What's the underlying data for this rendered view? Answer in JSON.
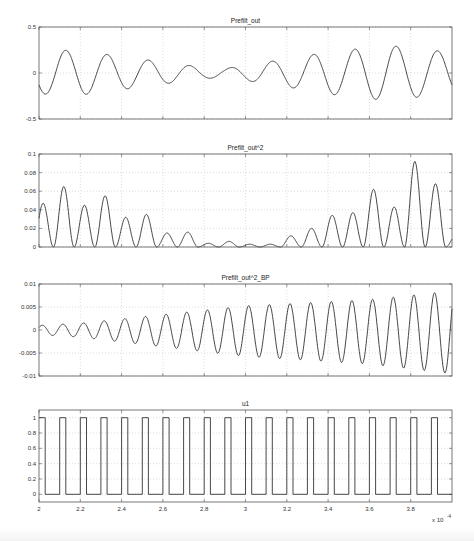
{
  "chart_data": [
    {
      "type": "line",
      "title": "Prefilt_out",
      "xlabel": "",
      "ylabel": "",
      "xlim": [
        2.0,
        4.0
      ],
      "ylim": [
        -0.5,
        0.5
      ],
      "yticks": [
        "0.5",
        "0",
        "-0.5"
      ],
      "ytick_values": [
        0.5,
        0,
        -0.5
      ],
      "grid": true,
      "signal_model": "sinusoid with slowly varying amplitude",
      "cycles": 10,
      "phase_start": "trough",
      "envelope_x": [
        2.0,
        2.1,
        2.2,
        2.3,
        2.4,
        2.5,
        2.6,
        2.7,
        2.8,
        2.9,
        3.0,
        3.1,
        3.2,
        3.3,
        3.4,
        3.5,
        3.6,
        3.7,
        3.8,
        3.9,
        4.0
      ],
      "envelope_y": [
        0.22,
        0.25,
        0.24,
        0.21,
        0.18,
        0.15,
        0.12,
        0.09,
        0.06,
        0.05,
        0.08,
        0.12,
        0.15,
        0.19,
        0.23,
        0.25,
        0.28,
        0.3,
        0.27,
        0.25,
        0.22
      ]
    },
    {
      "type": "line",
      "title": "Prefilt_out^2",
      "xlabel": "",
      "ylabel": "",
      "xlim": [
        2.0,
        4.0
      ],
      "ylim": [
        0,
        0.1
      ],
      "yticks": [
        "0.1",
        "0.08",
        "0.06",
        "0.04",
        "0.02",
        "0"
      ],
      "ytick_values": [
        0.1,
        0.08,
        0.06,
        0.04,
        0.02,
        0
      ],
      "grid": true,
      "signal_model": "square of Prefilt_out (rectified humps, ~20 peaks)",
      "peak_x": [
        2.02,
        2.12,
        2.22,
        2.32,
        2.42,
        2.52,
        2.62,
        2.72,
        2.82,
        2.92,
        3.02,
        3.12,
        3.22,
        3.32,
        3.42,
        3.52,
        3.62,
        3.72,
        3.82,
        3.92
      ],
      "peak_y": [
        0.047,
        0.065,
        0.045,
        0.055,
        0.032,
        0.035,
        0.015,
        0.016,
        0.004,
        0.006,
        0.003,
        0.003,
        0.012,
        0.02,
        0.034,
        0.037,
        0.062,
        0.043,
        0.092,
        0.068
      ]
    },
    {
      "type": "line",
      "title": "Prefilt_out^2_BP",
      "xlabel": "",
      "ylabel": "",
      "xlim": [
        2.0,
        4.0
      ],
      "ylim": [
        -0.01,
        0.01
      ],
      "yticks": [
        "0.01",
        "0.005",
        "0",
        "-0.005",
        "-0.01"
      ],
      "ytick_values": [
        0.01,
        0.005,
        0,
        -0.005,
        -0.01
      ],
      "grid": true,
      "signal_model": "band-passed oscillation, ~20 cycles, growing amplitude",
      "cycles": 20,
      "envelope_x": [
        2.0,
        2.2,
        2.4,
        2.6,
        2.8,
        3.0,
        3.2,
        3.4,
        3.6,
        3.8,
        4.0
      ],
      "envelope_y": [
        0.001,
        0.0015,
        0.0025,
        0.0035,
        0.0045,
        0.0055,
        0.006,
        0.0065,
        0.007,
        0.008,
        0.009
      ],
      "offset": 0.0
    },
    {
      "type": "line",
      "title": "u1",
      "xlabel": "",
      "ylabel": "",
      "xlim": [
        2.0,
        4.0
      ],
      "ylim": [
        -0.1,
        1.1
      ],
      "yticks": [
        "1",
        "0.8",
        "0.6",
        "0.4",
        "0.2",
        "0"
      ],
      "ytick_values": [
        1,
        0.8,
        0.6,
        0.4,
        0.2,
        0
      ],
      "xticks": [
        "2",
        "2.2",
        "2.4",
        "2.6",
        "2.8",
        "3",
        "3.2",
        "3.4",
        "3.6",
        "3.8"
      ],
      "xtick_values": [
        2.0,
        2.2,
        2.4,
        2.6,
        2.8,
        3.0,
        3.2,
        3.4,
        3.6,
        3.8
      ],
      "x_exponent_label": "x 10",
      "x_exponent_power": "-4",
      "grid": true,
      "signal_model": "square wave 0/1, period 0.1, 50% duty, starts high",
      "period": 0.1,
      "duty": 0.5,
      "low": 0,
      "high": 1
    }
  ],
  "layout": {
    "plot_left": 39,
    "plot_right": 452,
    "panels": [
      {
        "top": 27,
        "bottom": 119
      },
      {
        "top": 154,
        "bottom": 247
      },
      {
        "top": 284,
        "bottom": 376
      },
      {
        "top": 410,
        "bottom": 502
      }
    ],
    "x_grid_values": [
      2.0,
      2.2,
      2.4,
      2.6,
      2.8,
      3.0,
      3.2,
      3.4,
      3.6,
      3.8
    ]
  }
}
